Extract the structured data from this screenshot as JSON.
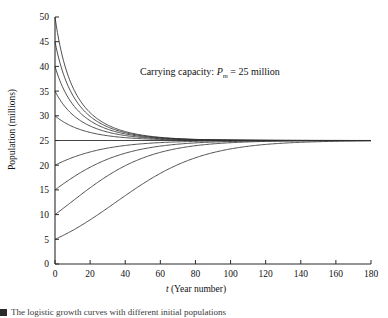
{
  "figure": {
    "caption": "The logistic growth curves with different initial populations"
  },
  "annotation": {
    "prefix": "Carrying capacity: ",
    "symbol": "P",
    "subscript": "m",
    "equals": " = 25 million",
    "full_text": "Carrying capacity: Pm = 25 million"
  },
  "axes": {
    "x_title_symbol": "t",
    "x_title_rest": " (Year number)",
    "y_title": "Population (millions)"
  },
  "chart_data": {
    "type": "line",
    "title": "",
    "xlabel": "t (Year number)",
    "ylabel": "Population (millions)",
    "xlim": [
      0,
      180
    ],
    "ylim": [
      0,
      50
    ],
    "xticks": [
      0,
      20,
      40,
      60,
      80,
      100,
      120,
      140,
      160,
      180
    ],
    "yticks": [
      0,
      5,
      10,
      15,
      20,
      25,
      30,
      35,
      40,
      45,
      50
    ],
    "grid": false,
    "legend": false,
    "carrying_capacity": 25,
    "annotations": [
      {
        "text": "Carrying capacity: Pm = 25 million",
        "x": 78,
        "y": 38
      }
    ],
    "series": [
      {
        "name": "P0 = 50",
        "initial_population": 50,
        "x": [
          0,
          10,
          20,
          30,
          40,
          50,
          60,
          80,
          100,
          120,
          140,
          160,
          180
        ],
        "values": [
          50,
          42.4,
          36.8,
          32.9,
          30.3,
          28.5,
          27.3,
          25.9,
          25.3,
          25.1,
          25.05,
          25.02,
          25.01
        ]
      },
      {
        "name": "P0 = 45",
        "initial_population": 45,
        "x": [
          0,
          10,
          20,
          30,
          40,
          50,
          60,
          80,
          100,
          120,
          140,
          160,
          180
        ],
        "values": [
          45,
          39.2,
          34.8,
          31.6,
          29.4,
          27.9,
          26.9,
          25.7,
          25.25,
          25.09,
          25.03,
          25.01,
          25.0
        ]
      },
      {
        "name": "P0 = 40",
        "initial_population": 40,
        "x": [
          0,
          10,
          20,
          30,
          40,
          50,
          60,
          80,
          100,
          120,
          140,
          160,
          180
        ],
        "values": [
          40,
          35.8,
          32.5,
          30.1,
          28.4,
          27.2,
          26.5,
          25.5,
          25.18,
          25.07,
          25.02,
          25.01,
          25.0
        ]
      },
      {
        "name": "P0 = 35",
        "initial_population": 35,
        "x": [
          0,
          10,
          20,
          30,
          40,
          50,
          60,
          80,
          100,
          120,
          140,
          160,
          180
        ],
        "values": [
          35,
          32.3,
          30.1,
          28.4,
          27.3,
          26.5,
          25.9,
          25.3,
          25.11,
          25.04,
          25.01,
          25.0,
          25.0
        ]
      },
      {
        "name": "P0 = 30",
        "initial_population": 30,
        "x": [
          0,
          10,
          20,
          30,
          40,
          50,
          60,
          80,
          100,
          120,
          140,
          160,
          180
        ],
        "values": [
          30,
          28.8,
          27.8,
          27.0,
          26.4,
          26.0,
          25.7,
          25.2,
          25.06,
          25.02,
          25.01,
          25.0,
          25.0
        ]
      },
      {
        "name": "P0 = 20",
        "initial_population": 20,
        "x": [
          0,
          10,
          20,
          30,
          40,
          50,
          60,
          80,
          100,
          120,
          140,
          160,
          180
        ],
        "values": [
          20,
          21.2,
          22.2,
          23.0,
          23.6,
          24.0,
          24.3,
          24.8,
          24.94,
          24.98,
          24.99,
          25.0,
          25.0
        ]
      },
      {
        "name": "P0 = 15",
        "initial_population": 15,
        "x": [
          0,
          10,
          20,
          30,
          40,
          50,
          60,
          80,
          100,
          120,
          140,
          160,
          180
        ],
        "values": [
          15,
          17.1,
          19.0,
          20.6,
          21.9,
          22.8,
          23.5,
          24.4,
          24.78,
          24.91,
          24.97,
          24.99,
          25.0
        ]
      },
      {
        "name": "P0 = 10",
        "initial_population": 10,
        "x": [
          0,
          10,
          20,
          30,
          40,
          50,
          60,
          80,
          100,
          120,
          140,
          160,
          180
        ],
        "values": [
          10,
          12.3,
          14.7,
          17.0,
          19.0,
          20.7,
          22.0,
          23.7,
          24.5,
          24.81,
          24.93,
          24.97,
          24.99
        ]
      },
      {
        "name": "P0 = 5",
        "initial_population": 5,
        "x": [
          0,
          10,
          20,
          30,
          40,
          50,
          60,
          80,
          100,
          120,
          140,
          160,
          180
        ],
        "values": [
          5,
          6.4,
          8.1,
          10.1,
          12.4,
          14.8,
          17.1,
          20.9,
          23.1,
          24.2,
          24.66,
          24.86,
          24.94
        ]
      }
    ]
  }
}
